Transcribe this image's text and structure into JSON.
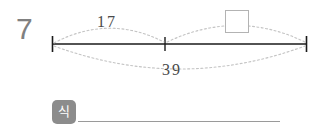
{
  "problem": {
    "number": "7"
  },
  "number_line": {
    "left_tick_x": 52,
    "middle_tick_x": 165,
    "right_tick_x": 307,
    "baseline_y": 44
  },
  "arcs": {
    "upper_left": {
      "label": "17",
      "from": "left-end",
      "to": "middle-tick"
    },
    "upper_right": {
      "label": "",
      "from": "middle-tick",
      "to": "right-end",
      "has_answer_box": true
    },
    "lower_total": {
      "label": "39",
      "from": "left-end",
      "to": "right-end"
    }
  },
  "answer_box": {
    "value": "",
    "placeholder": ""
  },
  "equation": {
    "tag_label": "식",
    "value": "",
    "placeholder": ""
  },
  "colors": {
    "number_gray": "#808080",
    "line_black": "#1a1a1a",
    "arc_gray": "#c0c0c0",
    "label_gray": "#4a4a4a",
    "tag_gray": "#8c8c8c",
    "box_border": "#b3b3b3",
    "underline": "#9a9a9a"
  }
}
